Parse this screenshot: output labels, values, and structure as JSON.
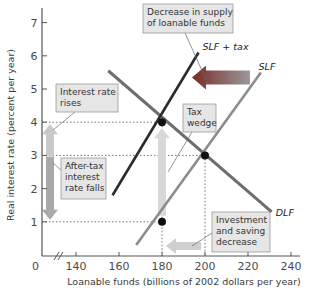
{
  "chart_data": {
    "type": "line",
    "title": "",
    "xlabel": "Loanable funds (billions of 2002 dollars per year)",
    "ylabel": "Real interest rate (percent per year)",
    "xlim": [
      130,
      245
    ],
    "ylim": [
      0,
      7.5
    ],
    "x_origin_label": "0",
    "x_axis_break": true,
    "x_ticks": [
      140,
      160,
      180,
      200,
      220,
      240
    ],
    "x_tick_labels": [
      "140",
      "160",
      "180",
      "200",
      "220",
      "240"
    ],
    "y_ticks": [
      1,
      2,
      3,
      4,
      5,
      6,
      7
    ],
    "y_tick_labels": [
      "1",
      "2",
      "3",
      "4",
      "5",
      "6",
      "7"
    ],
    "grid": false,
    "series": [
      {
        "name": "DLF",
        "label": "DLF",
        "color": "#6d6d6d",
        "points": [
          [
            155,
            5.55
          ],
          [
            231,
            1.3
          ]
        ]
      },
      {
        "name": "SLF",
        "label": "SLF",
        "color": "#8c8c8c",
        "points": [
          [
            168,
            0.3
          ],
          [
            226,
            5.5
          ]
        ]
      },
      {
        "name": "SLF + tax",
        "label": "SLF + tax",
        "color": "#2b2b2b",
        "points": [
          [
            157,
            1.8
          ],
          [
            197,
            6.1
          ]
        ]
      }
    ],
    "equilibria": [
      {
        "name": "with-tax-demand",
        "x": 180,
        "y": 4
      },
      {
        "name": "no-tax",
        "x": 200,
        "y": 3
      },
      {
        "name": "with-tax-supply",
        "x": 180,
        "y": 1
      }
    ],
    "reference_lines": [
      {
        "axis": "y",
        "value": 4
      },
      {
        "axis": "y",
        "value": 3
      },
      {
        "axis": "y",
        "value": 1
      },
      {
        "axis": "x",
        "value": 180
      },
      {
        "axis": "x",
        "value": 200
      }
    ],
    "annotations": [
      {
        "name": "supply-decrease",
        "lines": [
          "Decrease in supply",
          "of loanable funds"
        ]
      },
      {
        "name": "interest-rises",
        "lines": [
          "Interest rate",
          "rises"
        ]
      },
      {
        "name": "tax-wedge",
        "lines": [
          "Tax",
          "wedge"
        ]
      },
      {
        "name": "after-tax-falls",
        "lines": [
          "After-tax",
          "interest",
          "rate falls"
        ]
      },
      {
        "name": "investment-decrease",
        "lines": [
          "Investment",
          "and saving",
          "decrease"
        ]
      }
    ],
    "arrows": [
      {
        "name": "supply-shift-arrow",
        "direction": "left",
        "color": "#8a3a34"
      },
      {
        "name": "rate-rise-arrow",
        "direction": "up",
        "color": "#c9c9c9"
      },
      {
        "name": "rate-fall-arrow",
        "direction": "down",
        "color": "#a9a9a9"
      },
      {
        "name": "wedge-arrow",
        "direction": "up",
        "color": "#d8d8d8"
      },
      {
        "name": "quantity-decrease-arrow",
        "direction": "left",
        "color": "#cfcfcf"
      }
    ]
  }
}
